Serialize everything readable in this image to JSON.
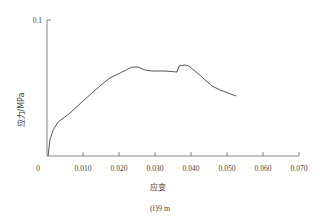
{
  "chart_data": {
    "type": "line",
    "title": "",
    "caption": "(f)9  m",
    "xlabel": "应变",
    "ylabel": "应力/MPa",
    "xlim": [
      0,
      0.07
    ],
    "ylim": [
      0,
      0.1
    ],
    "x_ticks": [
      "0",
      "0.010",
      "0.020",
      "0.030",
      "0.040",
      "0.050",
      "0.060",
      "0.070"
    ],
    "y_ticks": [
      "0.1"
    ],
    "grid": false,
    "legend": null,
    "series": [
      {
        "name": "stress-strain",
        "color": "#555555",
        "x": [
          0.0003,
          0.0008,
          0.0017,
          0.0031,
          0.0064,
          0.0103,
          0.0147,
          0.0175,
          0.0203,
          0.0236,
          0.0253,
          0.0272,
          0.0292,
          0.0328,
          0.0361,
          0.0367,
          0.0383,
          0.0394,
          0.0411,
          0.0433,
          0.0458,
          0.0481,
          0.0503,
          0.0525
        ],
        "y": [
          0.0,
          0.0118,
          0.0191,
          0.025,
          0.0316,
          0.0412,
          0.0515,
          0.0574,
          0.061,
          0.0654,
          0.0654,
          0.0632,
          0.0625,
          0.0625,
          0.0618,
          0.0662,
          0.0669,
          0.0662,
          0.0625,
          0.0574,
          0.0515,
          0.0485,
          0.0463,
          0.0441
        ]
      }
    ]
  }
}
